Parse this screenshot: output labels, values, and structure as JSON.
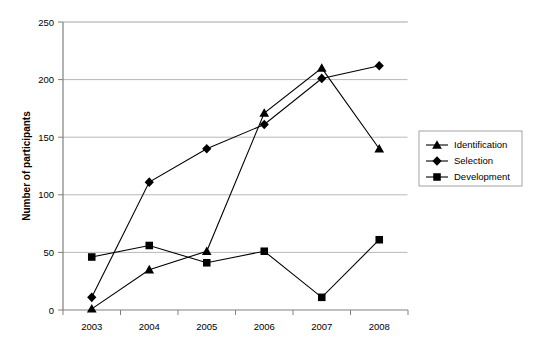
{
  "chart_data": {
    "type": "line",
    "title": "",
    "subtitle": "",
    "xlabel": "",
    "ylabel": "Number of participants",
    "categories": [
      "2003",
      "2004",
      "2005",
      "2006",
      "2007",
      "2008"
    ],
    "x": [
      2003,
      2004,
      2005,
      2006,
      2007,
      2008
    ],
    "series": [
      {
        "name": "Identification",
        "marker": "triangle",
        "color": "#000000",
        "values": [
          1,
          35,
          51,
          171,
          210,
          140
        ]
      },
      {
        "name": "Selection",
        "marker": "diamond",
        "color": "#000000",
        "values": [
          11,
          111,
          140,
          161,
          201,
          212
        ]
      },
      {
        "name": "Development",
        "marker": "square",
        "color": "#000000",
        "values": [
          46,
          56,
          41,
          51,
          11,
          61
        ]
      }
    ],
    "ylim": [
      0,
      250
    ],
    "yticks": [
      0,
      50,
      100,
      150,
      200,
      250
    ],
    "ytick_labels": [
      "0",
      "50",
      "100",
      "150",
      "200",
      "250"
    ],
    "xlim": [
      "2003",
      "2008"
    ],
    "grid": true,
    "grid_axis": "y",
    "grid_color": "#b0b0b0",
    "legend_position": "right",
    "legend_entries": [
      "Identification",
      "Selection",
      "Development"
    ],
    "plot_background": "#ffffff",
    "axis_color": "#808080",
    "line_color": "#000000"
  },
  "legend": {
    "items": [
      {
        "label": "Identification",
        "marker": "triangle"
      },
      {
        "label": "Selection",
        "marker": "diamond"
      },
      {
        "label": "Development",
        "marker": "square"
      }
    ]
  },
  "axes": {
    "y_title": "Number of participants",
    "y_ticks": [
      "250",
      "200",
      "150",
      "100",
      "50",
      "0"
    ],
    "x_ticks": [
      "2003",
      "2004",
      "2005",
      "2006",
      "2007",
      "2008"
    ]
  }
}
